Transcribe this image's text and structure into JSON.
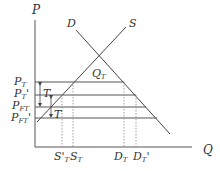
{
  "diagram": {
    "axes": {
      "y_label": "P",
      "x_label": "Q"
    },
    "curves": {
      "demand": "D",
      "supply": "S"
    },
    "equilibrium_label": "Q",
    "equilibrium_sub": "T",
    "price_labels": [
      {
        "main": "P",
        "sub": "T",
        "prime": ""
      },
      {
        "main": "P",
        "sub": "T",
        "prime": "'"
      },
      {
        "main": "P",
        "sub": "FT",
        "prime": ""
      },
      {
        "main": "P",
        "sub": "FT",
        "prime": "'"
      }
    ],
    "tax_labels": [
      "T",
      "T"
    ],
    "quantity_labels": [
      {
        "main": "S",
        "sub": "T",
        "prime": "'"
      },
      {
        "main": "S",
        "sub": "T",
        "prime": ""
      },
      {
        "main": "D",
        "sub": "T",
        "prime": ""
      },
      {
        "main": "D",
        "sub": "T",
        "prime": "'"
      }
    ]
  }
}
